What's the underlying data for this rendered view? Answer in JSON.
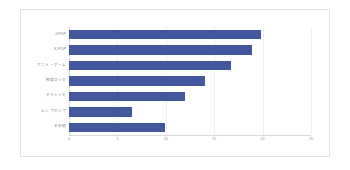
{
  "chart_data": {
    "type": "bar",
    "orientation": "horizontal",
    "title": "",
    "xlabel": "",
    "ylabel": "",
    "xlim": [
      0,
      25
    ],
    "grid": true,
    "legend": false,
    "bar_color": "#41589f",
    "xticks": [
      "0",
      "5",
      "10",
      "15",
      "20",
      "25"
    ],
    "xtick_values": [
      0,
      5,
      10,
      15,
      20,
      25
    ],
    "categories": [
      "J-POP",
      "K-POP",
      "アニメ・ゲーム",
      "邦楽ロック",
      "クラシック",
      "ヒップホップ",
      "その他"
    ],
    "values": [
      19.8,
      18.9,
      16.7,
      14.0,
      12.0,
      6.5,
      9.9
    ],
    "series": [
      {
        "name": "回答数",
        "values": [
          19.8,
          18.9,
          16.7,
          14.0,
          12.0,
          6.5,
          9.9
        ]
      }
    ]
  },
  "figure": {
    "background": "#ffffff",
    "frame_color": "#e2e2e2",
    "gridline_color": "#f0f0f0",
    "axis_color": "#d9d9d9",
    "tick_text_color": "#8a8a8a",
    "category_text_color": "#6d6d6d"
  }
}
